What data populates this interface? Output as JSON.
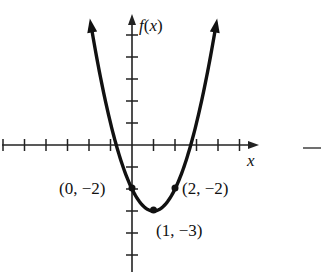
{
  "chart_data": {
    "type": "line",
    "title": "",
    "function": "f(x) = (x - 1)^2 - 3",
    "xlabel": "x",
    "ylabel": "f(x)",
    "xlim": [
      -6,
      6
    ],
    "ylim": [
      -5,
      6
    ],
    "grid": false,
    "x_ticks": [
      -6,
      -5,
      -4,
      -3,
      -2,
      -1,
      1,
      2,
      3,
      4,
      5
    ],
    "y_ticks": [
      -5,
      -4,
      -3,
      -2,
      -1,
      1,
      2,
      3,
      4,
      5
    ],
    "series": [
      {
        "name": "f(x)",
        "x": [
          -2,
          -1,
          0,
          1,
          2,
          3,
          4
        ],
        "values": [
          6,
          1,
          -2,
          -3,
          -2,
          1,
          6
        ]
      }
    ],
    "annotations": [
      {
        "text": "(0, −2)",
        "x": 0,
        "y": -2
      },
      {
        "text": "(1, −3)",
        "x": 1,
        "y": -3
      },
      {
        "text": "(2, −2)",
        "x": 2,
        "y": -2
      }
    ],
    "line_color": "#111111"
  },
  "labels": {
    "x_axis": "x",
    "y_axis_f": "f",
    "y_axis_paren": "(",
    "y_axis_var": "x",
    "y_axis_close": ")",
    "point_0": "(0, −2)",
    "point_1": "(1, −3)",
    "point_2": "(2, −2)"
  }
}
